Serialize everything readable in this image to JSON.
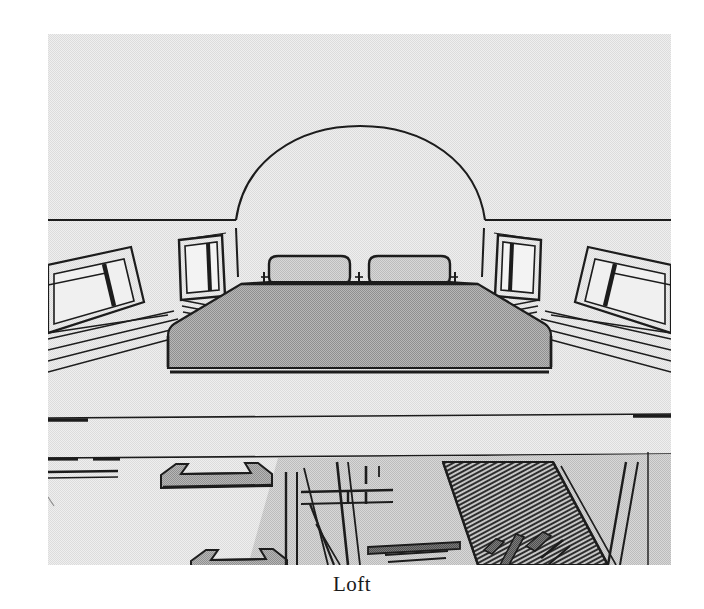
{
  "document": {
    "caption": "Loft",
    "figure_alt": "Loft"
  },
  "figure": {
    "title": "Loft",
    "view": "interior perspective looking toward bed under barrel-vault arch",
    "colors": {
      "background": "#e8e8e8",
      "paper": "#ffffff",
      "line": "#1c1c1c",
      "fill_mid_gray": "#a5a5a5",
      "fill_light_gray": "#c9c9c9",
      "fill_dark_gray": "#6e6e6e",
      "fill_stair_dark": "#3a3a3a",
      "caption_color": "#1a1a1a"
    },
    "frame": {
      "x": 48,
      "y": 34,
      "width": 623,
      "height": 531
    },
    "elements": [
      {
        "name": "arch-vault",
        "label": "Barrel vault arch"
      },
      {
        "name": "ceiling-line-left",
        "label": "Left ceiling eave line"
      },
      {
        "name": "ceiling-line-right",
        "label": "Right ceiling eave line"
      },
      {
        "name": "bed-platform",
        "label": "Bed"
      },
      {
        "name": "pillow-left",
        "label": "Left pillow"
      },
      {
        "name": "pillow-right",
        "label": "Right pillow"
      },
      {
        "name": "window-back-left",
        "label": "Back wall window, left"
      },
      {
        "name": "window-back-right",
        "label": "Back wall window, right"
      },
      {
        "name": "window-side-left",
        "label": "Side wall window, left"
      },
      {
        "name": "window-side-right",
        "label": "Side wall window, right"
      },
      {
        "name": "floor-edge-line",
        "label": "Loft floor edge"
      },
      {
        "name": "rail-upper-left",
        "label": "Upper loft rail"
      },
      {
        "name": "rail-lower-left",
        "label": "Lower loft rail"
      },
      {
        "name": "staircase",
        "label": "Staircase to lower level"
      },
      {
        "name": "lower-level-floor",
        "label": "Lower level floor"
      },
      {
        "name": "lower-level-table",
        "label": "Lower level table"
      },
      {
        "name": "lower-level-beam",
        "label": "Lower level beam"
      }
    ]
  }
}
